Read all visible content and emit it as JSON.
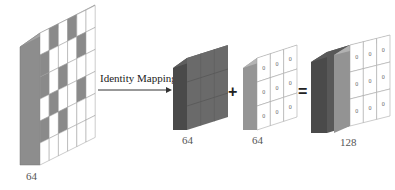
{
  "diagram": {
    "title": "",
    "arrow_label": "Identity Mapping",
    "plus_symbol": "+",
    "equals_symbol": "=",
    "blocks": [
      {
        "id": "input",
        "label": "64",
        "description": "input feature map with sparse/masked pattern"
      },
      {
        "id": "identity",
        "label": "64",
        "description": "identity-mapped feature map"
      },
      {
        "id": "zeros",
        "label": "64",
        "description": "zero-padded feature map",
        "cell_value": "0"
      },
      {
        "id": "concat",
        "label": "128",
        "description": "concatenated feature map"
      }
    ],
    "colors": {
      "dark_gray": "#4a4a4a",
      "mid_gray": "#8a8a8a",
      "light_gray": "#b0b0b0",
      "white": "#ffffff"
    }
  }
}
